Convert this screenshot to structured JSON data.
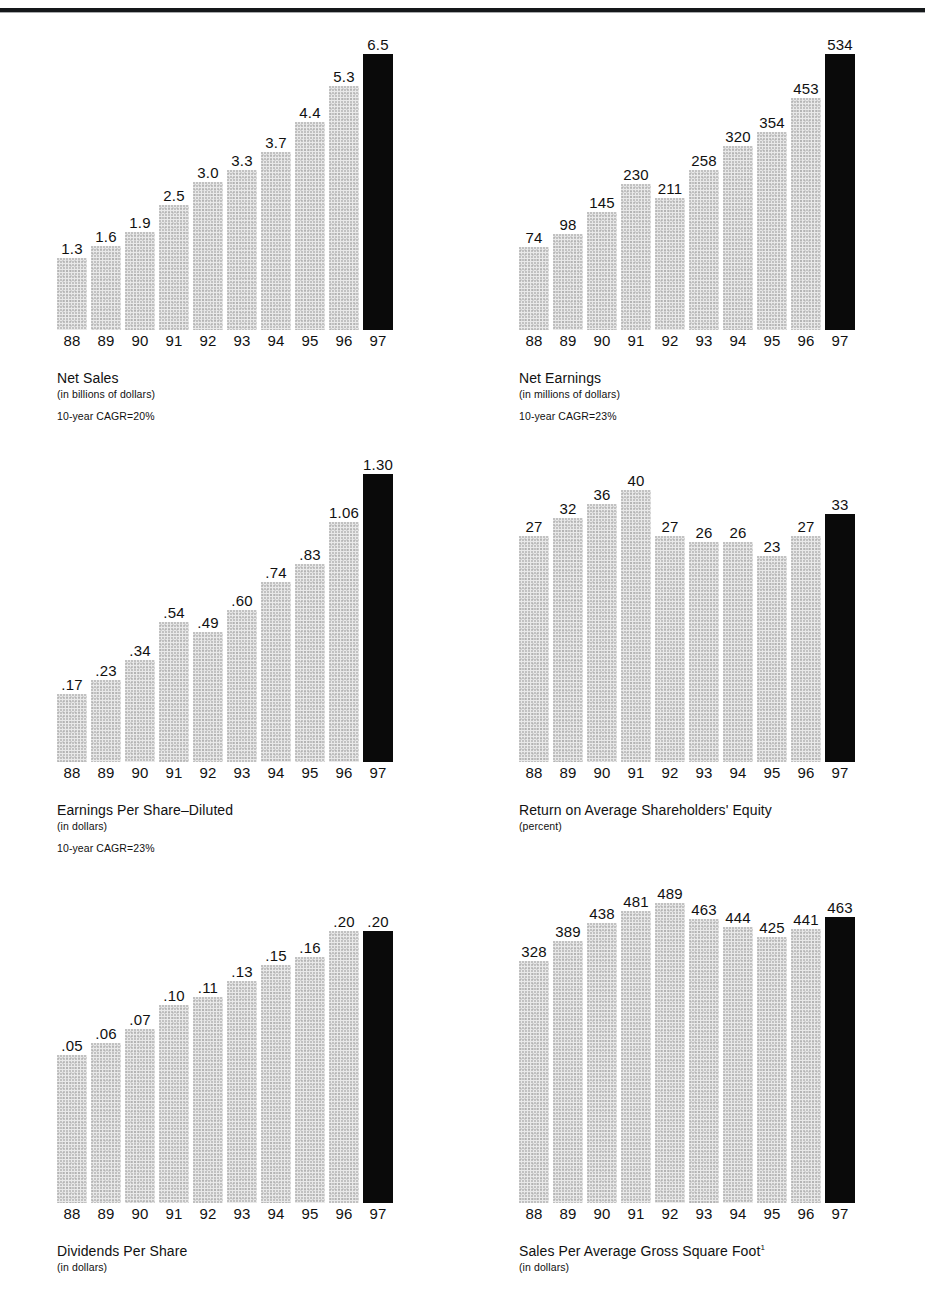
{
  "page": {
    "top_rule": true,
    "bar_color": "#e9e9e9",
    "highlight_color": "#0a0a0a",
    "text_color": "#111111",
    "years": [
      "88",
      "89",
      "90",
      "91",
      "92",
      "93",
      "94",
      "95",
      "96",
      "97"
    ]
  },
  "chart_data": [
    {
      "id": "net-sales",
      "type": "bar",
      "title": "Net Sales",
      "subtitle": "(in billions of dollars)",
      "note": "10-year CAGR=20%",
      "categories": [
        "88",
        "89",
        "90",
        "91",
        "92",
        "93",
        "94",
        "95",
        "96",
        "97"
      ],
      "values": [
        1.3,
        1.6,
        1.9,
        2.5,
        3.0,
        3.3,
        3.7,
        4.4,
        5.3,
        6.5
      ],
      "labels": [
        "1.3",
        "1.6",
        "1.9",
        "2.5",
        "3.0",
        "3.3",
        "3.7",
        "4.4",
        "5.3",
        "6.5"
      ],
      "bar_pixel_heights": [
        72,
        84,
        98,
        125,
        148,
        160,
        178,
        208,
        244,
        276
      ],
      "highlight_index": 9,
      "xlabel": "",
      "ylabel": "billions of dollars",
      "grid": false,
      "legend": "none"
    },
    {
      "id": "net-earnings",
      "type": "bar",
      "title": "Net Earnings",
      "subtitle": "(in millions of dollars)",
      "note": "10-year CAGR=23%",
      "categories": [
        "88",
        "89",
        "90",
        "91",
        "92",
        "93",
        "94",
        "95",
        "96",
        "97"
      ],
      "values": [
        74,
        98,
        145,
        211,
        230,
        258,
        320,
        354,
        453,
        534
      ],
      "labels": [
        "74",
        "98",
        "145",
        "230",
        "211",
        "258",
        "320",
        "354",
        "453",
        "534"
      ],
      "bar_pixel_heights": [
        83,
        96,
        118,
        146,
        132,
        160,
        184,
        198,
        232,
        276
      ],
      "highlight_index": 9,
      "xlabel": "",
      "ylabel": "millions of dollars",
      "grid": false,
      "legend": "none"
    },
    {
      "id": "earnings-per-share-diluted",
      "type": "bar",
      "title": "Earnings Per Share–Diluted",
      "subtitle": "(in dollars)",
      "note": "10-year CAGR=23%",
      "categories": [
        "88",
        "89",
        "90",
        "91",
        "92",
        "93",
        "94",
        "95",
        "96",
        "97"
      ],
      "values": [
        0.17,
        0.23,
        0.34,
        0.54,
        0.49,
        0.6,
        0.74,
        0.83,
        1.06,
        1.3
      ],
      "labels": [
        ".17",
        ".23",
        ".34",
        ".54",
        ".49",
        ".60",
        ".74",
        ".83",
        "1.06",
        "1.30"
      ],
      "bar_pixel_heights": [
        68,
        82,
        102,
        140,
        130,
        152,
        180,
        198,
        240,
        288
      ],
      "highlight_index": 9,
      "xlabel": "",
      "ylabel": "dollars",
      "grid": false,
      "legend": "none"
    },
    {
      "id": "return-on-average-shareholders-equity",
      "type": "bar",
      "title": "Return on Average Shareholders' Equity",
      "subtitle": "(percent)",
      "note": "",
      "categories": [
        "88",
        "89",
        "90",
        "91",
        "92",
        "93",
        "94",
        "95",
        "96",
        "97"
      ],
      "values": [
        27,
        32,
        36,
        40,
        27,
        26,
        26,
        23,
        27,
        33
      ],
      "labels": [
        "27",
        "32",
        "36",
        "40",
        "27",
        "26",
        "26",
        "23",
        "27",
        "33"
      ],
      "bar_pixel_heights": [
        226,
        244,
        258,
        272,
        226,
        220,
        220,
        206,
        226,
        248
      ],
      "highlight_index": 9,
      "xlabel": "",
      "ylabel": "percent",
      "grid": false,
      "legend": "none"
    },
    {
      "id": "dividends-per-share",
      "type": "bar",
      "title": "Dividends Per Share",
      "subtitle": "(in dollars)",
      "note": "",
      "categories": [
        "88",
        "89",
        "90",
        "91",
        "92",
        "93",
        "94",
        "95",
        "96",
        "97"
      ],
      "values": [
        0.05,
        0.06,
        0.07,
        0.1,
        0.11,
        0.13,
        0.15,
        0.16,
        0.2,
        0.2
      ],
      "labels": [
        ".05",
        ".06",
        ".07",
        ".10",
        ".11",
        ".13",
        ".15",
        ".16",
        ".20",
        ".20"
      ],
      "bar_pixel_heights": [
        148,
        160,
        174,
        198,
        206,
        222,
        238,
        246,
        272,
        272
      ],
      "highlight_index": 9,
      "xlabel": "",
      "ylabel": "dollars",
      "grid": false,
      "legend": "none"
    },
    {
      "id": "sales-per-average-gross-square-foot",
      "type": "bar",
      "title": "Sales Per Average Gross Square Foot",
      "title_superscript": "1",
      "subtitle": "(in dollars)",
      "note": "",
      "categories": [
        "88",
        "89",
        "90",
        "91",
        "92",
        "93",
        "94",
        "95",
        "96",
        "97"
      ],
      "values": [
        328,
        389,
        438,
        481,
        489,
        463,
        444,
        425,
        441,
        463
      ],
      "labels": [
        "328",
        "389",
        "438",
        "481",
        "489",
        "463",
        "444",
        "425",
        "441",
        "463"
      ],
      "bar_pixel_heights": [
        242,
        262,
        280,
        292,
        300,
        284,
        276,
        266,
        274,
        286
      ],
      "highlight_index": 9,
      "xlabel": "",
      "ylabel": "dollars",
      "grid": false,
      "legend": "none"
    }
  ]
}
